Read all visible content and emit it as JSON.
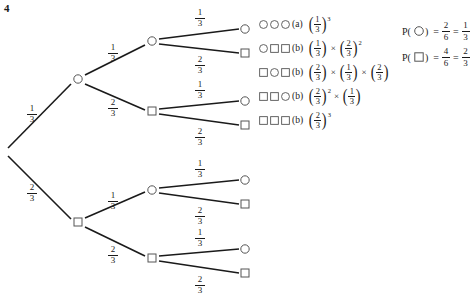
{
  "question_number": "4",
  "tree": {
    "root": {
      "x": 4,
      "y": 152,
      "shape": "none"
    },
    "nodes": [
      {
        "id": "n1-top",
        "x": 78,
        "y": 79,
        "shape": "circle"
      },
      {
        "id": "n1-bottom",
        "x": 78,
        "y": 222,
        "shape": "square"
      },
      {
        "id": "n2-a",
        "x": 152,
        "y": 41,
        "shape": "circle"
      },
      {
        "id": "n2-b",
        "x": 152,
        "y": 111,
        "shape": "square"
      },
      {
        "id": "n2-c",
        "x": 152,
        "y": 190,
        "shape": "circle"
      },
      {
        "id": "n2-d",
        "x": 152,
        "y": 258,
        "shape": "square"
      },
      {
        "id": "leaf-1",
        "x": 245,
        "y": 29,
        "shape": "circle"
      },
      {
        "id": "leaf-2",
        "x": 245,
        "y": 53,
        "shape": "square"
      },
      {
        "id": "leaf-3",
        "x": 245,
        "y": 101,
        "shape": "circle"
      },
      {
        "id": "leaf-4",
        "x": 245,
        "y": 125,
        "shape": "square"
      },
      {
        "id": "leaf-5",
        "x": 245,
        "y": 180,
        "shape": "circle"
      },
      {
        "id": "leaf-6",
        "x": 245,
        "y": 204,
        "shape": "square"
      },
      {
        "id": "leaf-7",
        "x": 245,
        "y": 249,
        "shape": "circle"
      },
      {
        "id": "leaf-8",
        "x": 245,
        "y": 273,
        "shape": "square"
      }
    ],
    "edges": [
      {
        "from": "root",
        "to": "n1-top",
        "x1": 8,
        "y1": 148,
        "x2": 71,
        "y2": 84
      },
      {
        "from": "root",
        "to": "n1-bottom",
        "x1": 8,
        "y1": 156,
        "x2": 71,
        "y2": 219
      },
      {
        "from": "n1-top",
        "to": "n2-a",
        "x1": 85,
        "y1": 75,
        "x2": 145,
        "y2": 45
      },
      {
        "from": "n1-top",
        "to": "n2-b",
        "x1": 85,
        "y1": 84,
        "x2": 145,
        "y2": 110
      },
      {
        "from": "n1-bottom",
        "to": "n2-c",
        "x1": 85,
        "y1": 218,
        "x2": 145,
        "y2": 192
      },
      {
        "from": "n1-bottom",
        "to": "n2-d",
        "x1": 85,
        "y1": 227,
        "x2": 145,
        "y2": 256
      },
      {
        "from": "n2-a",
        "to": "leaf-1",
        "x1": 159,
        "y1": 39,
        "x2": 239,
        "y2": 29
      },
      {
        "from": "n2-a",
        "to": "leaf-2",
        "x1": 159,
        "y1": 44,
        "x2": 239,
        "y2": 53
      },
      {
        "from": "n2-b",
        "to": "leaf-3",
        "x1": 159,
        "y1": 109,
        "x2": 239,
        "y2": 101
      },
      {
        "from": "n2-b",
        "to": "leaf-4",
        "x1": 159,
        "y1": 114,
        "x2": 239,
        "y2": 125
      },
      {
        "from": "n2-c",
        "to": "leaf-5",
        "x1": 159,
        "y1": 188,
        "x2": 239,
        "y2": 180
      },
      {
        "from": "n2-c",
        "to": "leaf-6",
        "x1": 159,
        "y1": 193,
        "x2": 239,
        "y2": 204
      },
      {
        "from": "n2-d",
        "to": "leaf-7",
        "x1": 159,
        "y1": 256,
        "x2": 239,
        "y2": 249
      },
      {
        "from": "n2-d",
        "to": "leaf-8",
        "x1": 159,
        "y1": 261,
        "x2": 239,
        "y2": 273
      }
    ],
    "branch_labels": [
      {
        "id": "lbl-root-up",
        "num": "1",
        "den": "3",
        "x": 25,
        "y": 104
      },
      {
        "id": "lbl-root-down",
        "num": "2",
        "den": "3",
        "x": 25,
        "y": 183
      },
      {
        "id": "lbl-l1-top-up",
        "num": "1",
        "den": "3",
        "x": 106,
        "y": 43
      },
      {
        "id": "lbl-l1-top-down",
        "num": "2",
        "den": "3",
        "x": 106,
        "y": 98
      },
      {
        "id": "lbl-l1-bot-up",
        "num": "1",
        "den": "3",
        "x": 106,
        "y": 191
      },
      {
        "id": "lbl-l1-bot-down",
        "num": "2",
        "den": "3",
        "x": 106,
        "y": 245
      },
      {
        "id": "lbl-l2-a-up",
        "num": "1",
        "den": "3",
        "x": 193,
        "y": 8
      },
      {
        "id": "lbl-l2-a-down",
        "num": "2",
        "den": "3",
        "x": 193,
        "y": 55
      },
      {
        "id": "lbl-l2-b-up",
        "num": "1",
        "den": "3",
        "x": 193,
        "y": 80
      },
      {
        "id": "lbl-l2-b-down",
        "num": "2",
        "den": "3",
        "x": 193,
        "y": 127
      },
      {
        "id": "lbl-l2-c-up",
        "num": "1",
        "den": "3",
        "x": 193,
        "y": 159
      },
      {
        "id": "lbl-l2-c-down",
        "num": "2",
        "den": "3",
        "x": 193,
        "y": 206
      },
      {
        "id": "lbl-l2-d-up",
        "num": "1",
        "den": "3",
        "x": 193,
        "y": 228
      },
      {
        "id": "lbl-l2-d-down",
        "num": "2",
        "den": "3",
        "x": 193,
        "y": 275
      }
    ]
  },
  "outcomes": [
    {
      "sequence": [
        "circle",
        "circle",
        "circle"
      ],
      "tag": "(a)",
      "terms": [
        {
          "num": "1",
          "den": "3",
          "exp": "3"
        }
      ]
    },
    {
      "sequence": [
        "circle",
        "square",
        "square"
      ],
      "tag": "(b)",
      "terms": [
        {
          "num": "1",
          "den": "3",
          "exp": ""
        },
        {
          "num": "2",
          "den": "3",
          "exp": "2"
        }
      ]
    },
    {
      "sequence": [
        "square",
        "circle",
        "square"
      ],
      "tag": "(b)",
      "terms": [
        {
          "num": "2",
          "den": "3",
          "exp": ""
        },
        {
          "num": "1",
          "den": "3",
          "exp": ""
        },
        {
          "num": "2",
          "den": "3",
          "exp": ""
        }
      ]
    },
    {
      "sequence": [
        "square",
        "square",
        "circle"
      ],
      "tag": "(b)",
      "terms": [
        {
          "num": "2",
          "den": "3",
          "exp": "2"
        },
        {
          "num": "1",
          "den": "3",
          "exp": ""
        }
      ]
    },
    {
      "sequence": [
        "square",
        "square",
        "square"
      ],
      "tag": "(b)",
      "terms": [
        {
          "num": "2",
          "den": "3",
          "exp": "3"
        }
      ]
    }
  ],
  "probabilities": [
    {
      "label_prefix": "P(",
      "symbol": "circle",
      "label_suffix": ")",
      "eq1": "=",
      "frac1": {
        "num": "2",
        "den": "6"
      },
      "eq2": "=",
      "frac2": {
        "num": "1",
        "den": "3"
      }
    },
    {
      "label_prefix": "P(",
      "symbol": "square",
      "label_suffix": ")",
      "eq1": "=",
      "frac1": {
        "num": "4",
        "den": "6"
      },
      "eq2": "=",
      "frac2": {
        "num": "2",
        "den": "3"
      }
    }
  ],
  "style": {
    "line_color": "#1a1a1a",
    "node_stroke": "#555555",
    "text_color": "#1a1a1a",
    "background": "#ffffff"
  }
}
